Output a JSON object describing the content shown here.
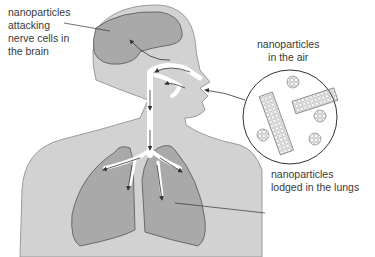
{
  "diagram": {
    "labels": {
      "brain": "nanoparticles\nattacking\nnerve cells in\nthe brain",
      "air": "nanoparticles\nin the air",
      "lungs": "nanoparticles\nlodged in the lungs"
    },
    "colors": {
      "body": "#d2d2d2",
      "organ": "#a9a9a9",
      "outline": "#666666",
      "airway": "#ffffff",
      "text": "#3a3a3a",
      "background": "#ffffff"
    },
    "inset": {
      "name": "magnified-air-sample",
      "contents": [
        "nanotube",
        "nanotube",
        "fullerene",
        "fullerene",
        "fullerene",
        "fullerene"
      ]
    }
  }
}
